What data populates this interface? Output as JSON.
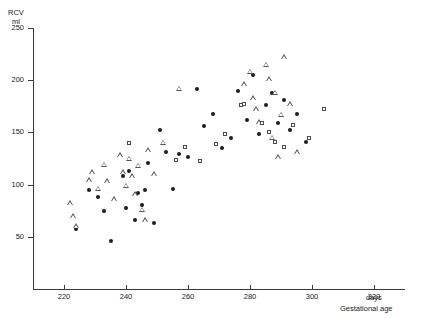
{
  "chart_data": {
    "type": "scatter",
    "title": "",
    "ylabel_line1": "RCV",
    "ylabel_line2": "ml",
    "xlabel_unit": "days",
    "xlabel": "Gestational age",
    "xlim": [
      210,
      330
    ],
    "ylim": [
      0,
      250
    ],
    "xticks": [
      220,
      240,
      260,
      280,
      300,
      320
    ],
    "yticks": [
      50,
      100,
      150,
      200,
      250
    ],
    "grid": false,
    "legend": "none",
    "series": [
      {
        "name": "filled-circle",
        "marker": "circle",
        "color": "#1c1c1c",
        "points": [
          [
            224,
            57
          ],
          [
            228,
            95
          ],
          [
            231,
            88
          ],
          [
            233,
            75
          ],
          [
            235,
            46
          ],
          [
            239,
            108
          ],
          [
            240,
            78
          ],
          [
            241,
            113
          ],
          [
            243,
            66
          ],
          [
            244,
            92
          ],
          [
            245,
            80
          ],
          [
            246,
            95
          ],
          [
            247,
            121
          ],
          [
            249,
            63
          ],
          [
            251,
            152
          ],
          [
            253,
            131
          ],
          [
            255,
            96
          ],
          [
            257,
            129
          ],
          [
            260,
            126
          ],
          [
            263,
            192
          ],
          [
            265,
            156
          ],
          [
            268,
            168
          ],
          [
            271,
            135
          ],
          [
            274,
            145
          ],
          [
            276,
            190
          ],
          [
            279,
            162
          ],
          [
            281,
            205
          ],
          [
            283,
            148
          ],
          [
            285,
            176
          ],
          [
            287,
            188
          ],
          [
            289,
            159
          ],
          [
            291,
            181
          ],
          [
            293,
            152
          ],
          [
            295,
            168
          ],
          [
            298,
            141
          ]
        ]
      },
      {
        "name": "open-triangle",
        "marker": "triangle",
        "color": "#555555",
        "points": [
          [
            222,
            82
          ],
          [
            223,
            70
          ],
          [
            224,
            60
          ],
          [
            228,
            104
          ],
          [
            229,
            112
          ],
          [
            231,
            96
          ],
          [
            233,
            119
          ],
          [
            234,
            103
          ],
          [
            236,
            86
          ],
          [
            238,
            128
          ],
          [
            239,
            112
          ],
          [
            240,
            99
          ],
          [
            241,
            125
          ],
          [
            242,
            108
          ],
          [
            243,
            91
          ],
          [
            244,
            118
          ],
          [
            245,
            76
          ],
          [
            246,
            66
          ],
          [
            247,
            133
          ],
          [
            249,
            110
          ],
          [
            252,
            140
          ],
          [
            257,
            192
          ],
          [
            278,
            196
          ],
          [
            280,
            208
          ],
          [
            281,
            183
          ],
          [
            282,
            172
          ],
          [
            283,
            160
          ],
          [
            285,
            215
          ],
          [
            286,
            201
          ],
          [
            287,
            145
          ],
          [
            288,
            188
          ],
          [
            289,
            126
          ],
          [
            290,
            167
          ],
          [
            291,
            222
          ],
          [
            293,
            177
          ],
          [
            295,
            131
          ]
        ]
      },
      {
        "name": "open-square",
        "marker": "square",
        "color": "#4a4a4a",
        "points": [
          [
            241,
            140
          ],
          [
            256,
            124
          ],
          [
            259,
            136
          ],
          [
            264,
            123
          ],
          [
            269,
            139
          ],
          [
            272,
            148
          ],
          [
            277,
            176
          ],
          [
            278,
            177
          ],
          [
            284,
            159
          ],
          [
            286,
            150
          ],
          [
            288,
            141
          ],
          [
            291,
            136
          ],
          [
            294,
            157
          ],
          [
            299,
            145
          ],
          [
            304,
            172
          ]
        ]
      }
    ]
  },
  "axes": {
    "y_tick_labels": [
      "250",
      "200",
      "150",
      "100",
      "50"
    ],
    "x_tick_labels": [
      "220",
      "240",
      "260",
      "280",
      "300",
      "320"
    ]
  }
}
